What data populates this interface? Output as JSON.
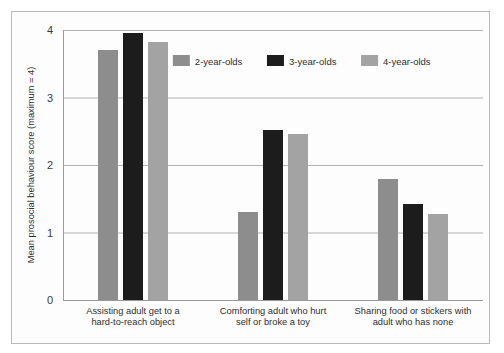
{
  "chart_data": {
    "type": "bar",
    "title": "",
    "subtitle": "",
    "xlabel": "",
    "ylabel": "Mean prosocial behaviour score (maximum = 4)",
    "ylim": [
      0,
      4
    ],
    "yticks": [
      "0",
      "1",
      "2",
      "3",
      "4"
    ],
    "ytick_values": [
      0,
      1,
      2,
      3,
      4
    ],
    "grid": true,
    "legend_position": "top-right",
    "categories": [
      "Assisting adult get to a hard-to-reach object",
      "Comforting adult who hurt self or broke a toy",
      "Sharing food or stickers with adult who has none"
    ],
    "category_lines": [
      [
        "Assisting adult get to a",
        "hard-to-reach object"
      ],
      [
        "Comforting adult who hurt",
        "self or broke a toy"
      ],
      [
        "Sharing food or stickers with",
        "adult who has none"
      ]
    ],
    "series": [
      {
        "name": "2-year-olds",
        "color": "#8d8d8d",
        "values": [
          3.7,
          1.3,
          1.8
        ]
      },
      {
        "name": "3-year-olds",
        "color": "#1c1c1c",
        "values": [
          3.95,
          2.52,
          1.42
        ]
      },
      {
        "name": "4-year-olds",
        "color": "#a3a3a3",
        "values": [
          3.82,
          2.46,
          1.28
        ]
      }
    ]
  },
  "legend": {
    "items": [
      {
        "label": "2-year-olds",
        "color": "#8d8d8d"
      },
      {
        "label": "3-year-olds",
        "color": "#1c1c1c"
      },
      {
        "label": "4-year-olds",
        "color": "#a3a3a3"
      }
    ]
  },
  "colors": {
    "frame_border": "#b9b9b9",
    "gridline": "#b2b2b2",
    "axis": "#9a9a9a",
    "background": "#ffffff",
    "text": "#2e2e2e"
  }
}
